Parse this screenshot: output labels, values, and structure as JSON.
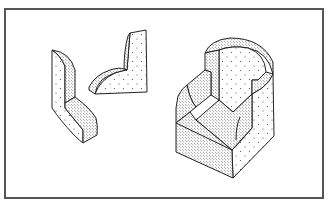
{
  "figure": {
    "frame_color": "#555555",
    "line_color": "#222222",
    "background": "#ffffff",
    "objects": [
      {
        "name": "l-shaped-block",
        "shading": "stippled"
      },
      {
        "name": "curved-l-bracket",
        "shading": "stippled"
      },
      {
        "name": "armchair-block",
        "shading": "stippled"
      }
    ]
  }
}
